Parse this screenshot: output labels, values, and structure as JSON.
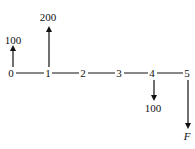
{
  "diagram": {
    "type": "cash-flow-diagram",
    "periods": [
      "0",
      "1",
      "2",
      "3",
      "4",
      "5"
    ],
    "cash_flows": [
      {
        "period": "0",
        "label": "100",
        "direction": "up"
      },
      {
        "period": "1",
        "label": "200",
        "direction": "up"
      },
      {
        "period": "4",
        "label": "100",
        "direction": "down"
      },
      {
        "period": "5",
        "label": "F",
        "direction": "down"
      }
    ],
    "line_color": "#111111"
  }
}
